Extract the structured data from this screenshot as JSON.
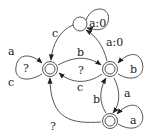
{
  "diagram": {
    "type": "state-machine",
    "nodes": [
      {
        "id": "top",
        "accepting": false,
        "label": "",
        "self_loop": "a:0"
      },
      {
        "id": "left",
        "accepting": true,
        "label": "",
        "self_loop": "?",
        "self_loop_extra": [
          "a",
          "c"
        ]
      },
      {
        "id": "right",
        "accepting": true,
        "label": "",
        "self_loop": "b"
      },
      {
        "id": "bottom",
        "accepting": true,
        "label": "",
        "self_loop": "a"
      }
    ],
    "edges": [
      {
        "from": "top",
        "to": "left",
        "label": "c"
      },
      {
        "from": "right",
        "to": "top",
        "label": "a:0"
      },
      {
        "from": "left",
        "to": "right",
        "label": "b"
      },
      {
        "from": "right",
        "to": "left",
        "label": "?"
      },
      {
        "from": "right",
        "to": "left",
        "label": "c"
      },
      {
        "from": "right",
        "to": "bottom",
        "label": "a"
      },
      {
        "from": "bottom",
        "to": "right",
        "label": "b"
      },
      {
        "from": "bottom",
        "to": "left",
        "label": "?"
      }
    ],
    "labels": {
      "top_self": "a:0",
      "top_to_left": "c",
      "right_to_top": "a:0",
      "left_loop_q": "?",
      "left_loop_a": "a",
      "left_loop_c": "c",
      "left_to_right": "b",
      "right_to_left_q": "?",
      "right_to_left_c": "c",
      "right_self": "b",
      "right_to_bottom": "a",
      "bottom_to_right": "b",
      "bottom_self": "a",
      "bottom_to_left": "?"
    }
  }
}
